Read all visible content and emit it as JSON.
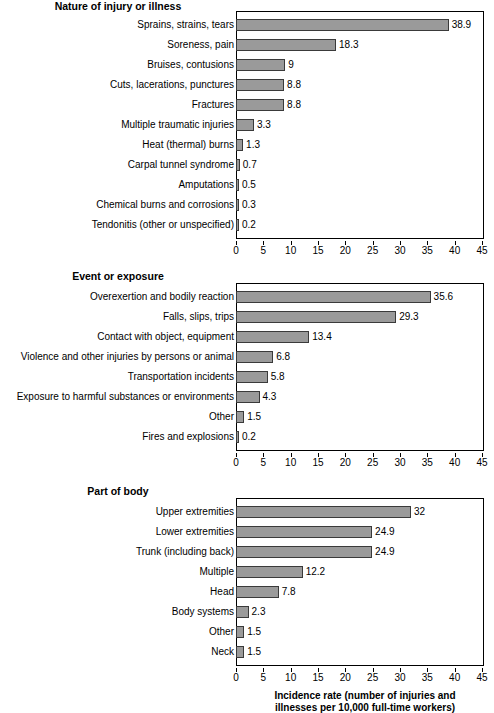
{
  "figure": {
    "axis_title_line1": "Incidence rate (number of injuries and",
    "axis_title_line2": "illnesses per 10,000 full-time workers)"
  },
  "axis": {
    "ticks": [
      "0",
      "5",
      "10",
      "15",
      "20",
      "25",
      "30",
      "35",
      "40",
      "45"
    ],
    "min": 0,
    "max": 45
  },
  "colors": {
    "bar_fill": "#9a9a9a",
    "bar_border": "#3a3a3a",
    "axis": "#000000",
    "background": "#ffffff"
  },
  "chart_data": [
    {
      "type": "bar",
      "orientation": "horizontal",
      "title": "Nature of injury or illness",
      "xlabel": "Incidence rate (number of injuries and illnesses per 10,000 full-time workers)",
      "ylabel": "",
      "xlim": [
        0,
        45
      ],
      "grid": false,
      "legend": "none",
      "categories": [
        "Sprains, strains, tears",
        "Soreness, pain",
        "Bruises, contusions",
        "Cuts, lacerations, punctures",
        "Fractures",
        "Multiple traumatic injuries",
        "Heat (thermal) burns",
        "Carpal tunnel syndrome",
        "Amputations",
        "Chemical burns and corrosions",
        "Tendonitis (other or unspecified)"
      ],
      "values": [
        38.9,
        18.3,
        9,
        8.8,
        8.8,
        3.3,
        1.3,
        0.7,
        0.5,
        0.3,
        0.2
      ],
      "value_labels": [
        "38.9",
        "18.3",
        "9",
        "8.8",
        "8.8",
        "3.3",
        "1.3",
        "0.7",
        "0.5",
        "0.3",
        "0.2"
      ]
    },
    {
      "type": "bar",
      "orientation": "horizontal",
      "title": "Event or exposure",
      "xlabel": "Incidence rate (number of injuries and illnesses per 10,000 full-time workers)",
      "ylabel": "",
      "xlim": [
        0,
        45
      ],
      "grid": false,
      "legend": "none",
      "categories": [
        "Overexertion and bodily reaction",
        "Falls, slips, trips",
        "Contact with object, equipment",
        "Violence and other injuries by persons or animal",
        "Transportation incidents",
        "Exposure to harmful substances or environments",
        "Other",
        "Fires and explosions"
      ],
      "values": [
        35.6,
        29.3,
        13.4,
        6.8,
        5.8,
        4.3,
        1.5,
        0.2
      ],
      "value_labels": [
        "35.6",
        "29.3",
        "13.4",
        "6.8",
        "5.8",
        "4.3",
        "1.5",
        "0.2"
      ]
    },
    {
      "type": "bar",
      "orientation": "horizontal",
      "title": "Part of body",
      "xlabel": "Incidence rate (number of injuries and illnesses per 10,000 full-time workers)",
      "ylabel": "",
      "xlim": [
        0,
        45
      ],
      "grid": false,
      "legend": "none",
      "categories": [
        "Upper extremities",
        "Lower extremities",
        "Trunk (including back)",
        "Multiple",
        "Head",
        "Body systems",
        "Other",
        "Neck"
      ],
      "values": [
        32,
        24.9,
        24.9,
        12.2,
        7.8,
        2.3,
        1.5,
        1.5
      ],
      "value_labels": [
        "32",
        "24.9",
        "24.9",
        "12.2",
        "7.8",
        "2.3",
        "1.5",
        "1.5"
      ]
    }
  ]
}
